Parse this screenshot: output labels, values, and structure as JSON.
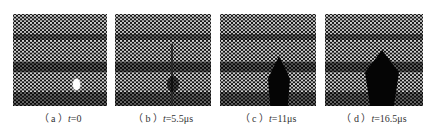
{
  "figure": {
    "panels": [
      {
        "id": "a",
        "label": "（ a ）",
        "var": "t",
        "value": "=0"
      },
      {
        "id": "b",
        "label": "（ b ）",
        "var": "t",
        "value": "=5.5μs"
      },
      {
        "id": "c",
        "label": "（ c ）",
        "var": "t",
        "value": "=11μs"
      },
      {
        "id": "d",
        "label": "（ d ）",
        "var": "t",
        "value": "=16.5μs"
      }
    ]
  }
}
